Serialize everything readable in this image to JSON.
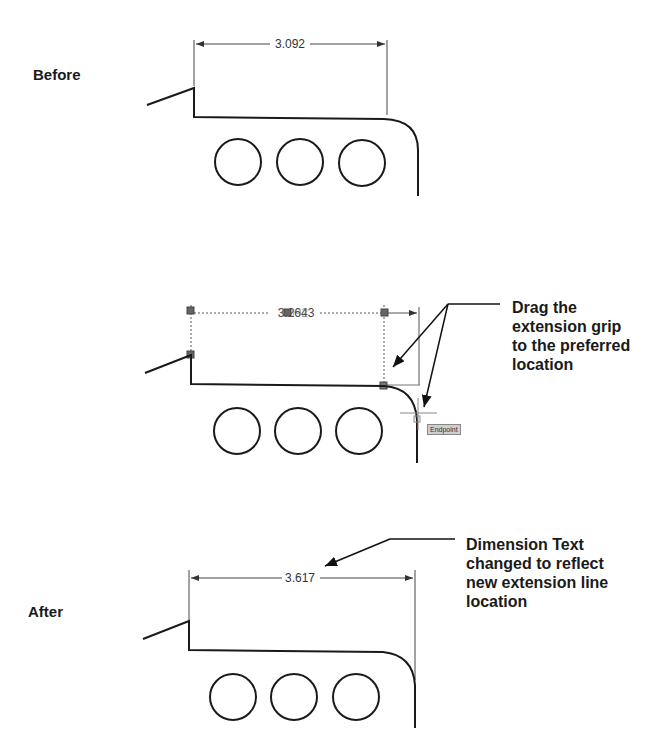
{
  "panels": {
    "before": {
      "label": "Before",
      "dimension_value": "3.092"
    },
    "during": {
      "dimension_value_overlap": "3.0 92643",
      "dimension_value_old": "3.092",
      "dimension_value_new": "3.2643",
      "snap_tooltip": "Endpoint",
      "callout": "Drag the\nextension grip\nto the preferred\nlocation"
    },
    "after": {
      "label": "After",
      "dimension_value": "3.617",
      "callout": "Dimension Text\nchanged to reflect\nnew extension line\nlocation"
    }
  },
  "icons": {
    "grip": "square-grip-icon",
    "crosshair": "crosshair-cursor-icon",
    "arrow": "leader-arrow-icon"
  },
  "colors": {
    "line": "#1a1a1a",
    "grip": "#666666",
    "tooltip_bg": "#cfcfcf",
    "dim_line": "#444444"
  }
}
